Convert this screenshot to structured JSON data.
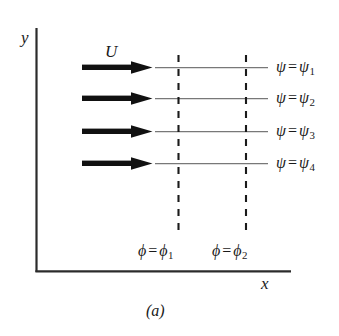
{
  "figure": {
    "caption": "(a)",
    "axes": {
      "y_label": "y",
      "x_label": "x",
      "color": "#2b2b2b"
    },
    "flow": {
      "velocity_label": "U",
      "arrow_color": "#111111",
      "streamline_color": "#777777",
      "equipotential_color": "#1a1a1a"
    },
    "streamlines": [
      {
        "symbol": "ψ",
        "equals": "=",
        "value_symbol": "ψ",
        "subscript": "1"
      },
      {
        "symbol": "ψ",
        "equals": "=",
        "value_symbol": "ψ",
        "subscript": "2"
      },
      {
        "symbol": "ψ",
        "equals": "=",
        "value_symbol": "ψ",
        "subscript": "3"
      },
      {
        "symbol": "ψ",
        "equals": "=",
        "value_symbol": "ψ",
        "subscript": "4"
      }
    ],
    "equipotentials": [
      {
        "symbol": "ϕ",
        "equals": "=",
        "value_symbol": "ϕ",
        "subscript": "1"
      },
      {
        "symbol": "ϕ",
        "equals": "=",
        "value_symbol": "ϕ",
        "subscript": "2"
      }
    ]
  }
}
